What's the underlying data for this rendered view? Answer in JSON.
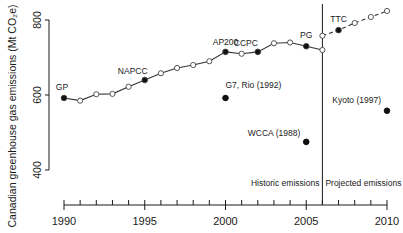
{
  "chart_data": {
    "type": "line",
    "title": "",
    "xlabel": "",
    "ylabel": "Canadian greenhouse gas emissions (Mt CO₂e)",
    "xlim": [
      1990,
      2010
    ],
    "ylim": [
      400,
      800
    ],
    "x_ticks": [
      1990,
      1995,
      2000,
      2005,
      2010
    ],
    "y_ticks": [
      400,
      600,
      800
    ],
    "grid": false,
    "divider": {
      "x": 2006,
      "left_label": "Historic emissions",
      "right_label": "Projected emissions"
    },
    "series": [
      {
        "name": "Historic emissions",
        "style": "solid",
        "x": [
          1990,
          1991,
          1992,
          1993,
          1994,
          1995,
          1996,
          1997,
          1998,
          1999,
          2000,
          2001,
          2002,
          2003,
          2004,
          2005,
          2006
        ],
        "values": [
          592,
          585,
          602,
          603,
          622,
          640,
          658,
          672,
          680,
          690,
          715,
          710,
          715,
          738,
          740,
          730,
          720
        ],
        "filled": [
          true,
          false,
          false,
          false,
          false,
          true,
          false,
          false,
          false,
          false,
          true,
          false,
          true,
          false,
          false,
          true,
          false
        ]
      },
      {
        "name": "Projected emissions",
        "style": "dashed",
        "x": [
          2006,
          2007,
          2008,
          2009,
          2010
        ],
        "values": [
          758,
          773,
          792,
          808,
          824
        ],
        "filled": [
          false,
          true,
          false,
          false,
          false
        ]
      }
    ],
    "annotations": [
      {
        "label": "GP",
        "x": 1990,
        "y": 592,
        "on_line": true
      },
      {
        "label": "NAPCC",
        "x": 1995,
        "y": 640,
        "on_line": true
      },
      {
        "label": "AP200",
        "x": 2000,
        "y": 715,
        "on_line": true
      },
      {
        "label": "CCPC",
        "x": 2002,
        "y": 715,
        "on_line": true
      },
      {
        "label": "PG",
        "x": 2005,
        "y": 730,
        "on_line": true
      },
      {
        "label": "TTC",
        "x": 2007,
        "y": 773,
        "on_line": true
      },
      {
        "label": "G7, Rio (1992)",
        "x": 2000,
        "y": 592,
        "on_line": false
      },
      {
        "label": "WCCA (1988)",
        "x": 2005,
        "y": 475,
        "on_line": false
      },
      {
        "label": "Kyoto (1997)",
        "x": 2010,
        "y": 558,
        "on_line": false
      }
    ]
  }
}
